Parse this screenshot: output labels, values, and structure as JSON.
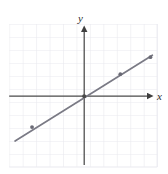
{
  "figure": {
    "name": "coordinate-plane-line-graph",
    "background_color": "#ffffff",
    "width": 168,
    "height": 174
  },
  "labels": {
    "x_axis": "x",
    "y_axis": "y"
  },
  "colors": {
    "grid": "#e9e9ef",
    "axis": "#4a4a4a",
    "line": "#7a7a85",
    "point": "#6a6a75",
    "label": "#2b2b2b"
  },
  "chart_data": {
    "type": "line",
    "title": "",
    "xlabel": "x",
    "ylabel": "y",
    "grid": true,
    "legend": "none",
    "xlim": [
      -5.75,
      5.6
    ],
    "ylim": [
      -5.45,
      5.55
    ],
    "x_tick_labels": [],
    "y_tick_labels": [],
    "grid_step": 1,
    "axis_arrows": {
      "x_positive": true,
      "y_positive": true,
      "x_negative": false,
      "y_negative": false
    },
    "series": [
      {
        "name": "line",
        "slope": 0.55,
        "intercept": 0,
        "equation": "y = 0.55x",
        "x": [
          -5.3,
          4.0,
          5.2
        ],
        "y": [
          -3.45,
          2.2,
          3.0
        ],
        "marker_points": [
          {
            "x": -4.0,
            "y": -2.38
          },
          {
            "x": 2.77,
            "y": 1.69
          },
          {
            "x": 5.08,
            "y": 3.0
          }
        ],
        "segment_start": {
          "x": -5.3,
          "y": -3.45
        },
        "segment_end": {
          "x": 5.23,
          "y": 3.15
        }
      }
    ]
  }
}
